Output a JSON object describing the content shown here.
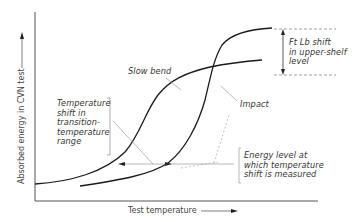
{
  "diagram": {
    "type": "Charpy V-notch transition curve comparison",
    "x_axis_label": "Test temperature",
    "y_axis_label": "Absorbed energy in CVN test",
    "curves": [
      {
        "name": "Slow bend",
        "label": "Slow bend"
      },
      {
        "name": "Impact",
        "label": "Impact"
      }
    ],
    "annotations": {
      "upper_shelf_shift": [
        "Ft Lb shift",
        "in upper-shelf",
        "level"
      ],
      "temperature_shift": [
        "Temperature",
        "shift in",
        "transition-",
        "temperature",
        "range"
      ],
      "energy_level": [
        "Energy level at",
        "which temperature",
        "shift is measured"
      ]
    },
    "colors": {
      "curve": "#1a1a1a",
      "axis": "#555555",
      "dashed": "#888888",
      "leader": "#999999"
    }
  }
}
